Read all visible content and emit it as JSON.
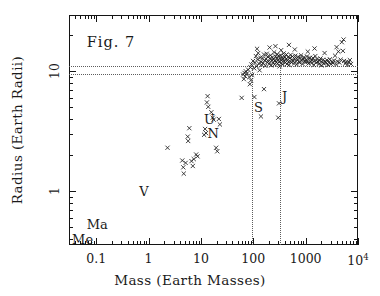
{
  "figure": {
    "label": "Fig. 7",
    "background": "#ffffff",
    "ink": "#1a1a1a"
  },
  "axes": {
    "x": {
      "title": "Mass (Earth Masses)",
      "scale": "log",
      "min": 0.0302,
      "max": 10000,
      "ticks": [
        {
          "value": 0.1,
          "label": "0.1"
        },
        {
          "value": 1,
          "label": "1"
        },
        {
          "value": 10,
          "label": "10"
        },
        {
          "value": 100,
          "label": "100"
        },
        {
          "value": 1000,
          "label": "1000"
        },
        {
          "value": 10000,
          "label": "10",
          "sup": "4"
        }
      ]
    },
    "y": {
      "title": "Radius (Earth Radii)",
      "scale": "log",
      "min": 0.355,
      "max": 29.5,
      "ticks": [
        {
          "value": 1,
          "label": "1"
        },
        {
          "value": 10,
          "label": "10"
        }
      ]
    }
  },
  "guides": {
    "horizontal": [
      {
        "name": "jupiter-radius",
        "value": 11.0
      },
      {
        "name": "saturn-radius",
        "value": 9.45
      }
    ],
    "vertical": [
      {
        "name": "saturn-mass",
        "value": 95.0
      },
      {
        "name": "jupiter-mass",
        "value": 318.0
      }
    ],
    "color": "#5d5d5d"
  },
  "annotations": [
    {
      "name": "mercury-label",
      "text": "Me",
      "x": 0.055,
      "y": 0.4
    },
    {
      "name": "mars-label",
      "text": "Ma",
      "x": 0.105,
      "y": 0.53
    },
    {
      "name": "venus-label",
      "text": "V",
      "x": 0.82,
      "y": 1.0
    },
    {
      "name": "uranus-label",
      "text": "U",
      "x": 14.5,
      "y": 4.0
    },
    {
      "name": "neptune-label",
      "text": "N",
      "x": 17.2,
      "y": 3.05
    },
    {
      "name": "saturn-label",
      "text": "S",
      "x": 125,
      "y": 5.0
    },
    {
      "name": "jupiter-label",
      "text": "J",
      "x": 395,
      "y": 6.2
    }
  ],
  "chart_data": {
    "type": "scatter",
    "title": "Fig. 7",
    "xlabel": "Mass (Earth Masses)",
    "ylabel": "Radius (Earth Radii)",
    "xscale": "log",
    "yscale": "log",
    "xlim": [
      0.0302,
      10000
    ],
    "ylim": [
      0.355,
      29.5
    ],
    "grid": false,
    "legend": null,
    "marker": "x",
    "marker_color": "#1e1e1e",
    "series": [
      {
        "name": "planets",
        "points": [
          [
            2.3,
            2.3
          ],
          [
            4.4,
            1.8
          ],
          [
            4.6,
            1.58
          ],
          [
            4.7,
            1.4
          ],
          [
            5.1,
            1.72
          ],
          [
            5.6,
            2.85
          ],
          [
            5.7,
            2.62
          ],
          [
            6.0,
            3.35
          ],
          [
            6.6,
            1.78
          ],
          [
            7.0,
            1.62
          ],
          [
            7.3,
            1.85
          ],
          [
            8.1,
            2.02
          ],
          [
            8.6,
            1.95
          ],
          [
            11.5,
            2.95
          ],
          [
            12.0,
            3.3
          ],
          [
            12.5,
            3.05
          ],
          [
            13.0,
            5.5
          ],
          [
            13.4,
            6.2
          ],
          [
            13.8,
            5.05
          ],
          [
            15.8,
            4.55
          ],
          [
            16.8,
            4.1
          ],
          [
            17.5,
            3.95
          ],
          [
            19.5,
            2.3
          ],
          [
            20.5,
            2.15
          ],
          [
            22.0,
            4.0
          ],
          [
            23.0,
            3.6
          ],
          [
            60,
            6.0
          ],
          [
            66,
            8.6
          ],
          [
            70,
            9.1
          ],
          [
            76,
            9.6
          ],
          [
            80,
            10.3
          ],
          [
            84,
            8.95
          ],
          [
            88,
            10.8
          ],
          [
            92,
            11.4
          ],
          [
            95,
            9.35
          ],
          [
            99,
            12.2
          ],
          [
            104,
            10.6
          ],
          [
            108,
            11.8
          ],
          [
            112,
            13.4
          ],
          [
            116,
            11.0
          ],
          [
            120,
            12.6
          ],
          [
            124,
            14.2
          ],
          [
            128,
            11.6
          ],
          [
            132,
            10.2
          ],
          [
            136,
            13.0
          ],
          [
            140,
            12.0
          ],
          [
            145,
            11.3
          ],
          [
            150,
            12.9
          ],
          [
            155,
            11.7
          ],
          [
            160,
            13.8
          ],
          [
            165,
            12.3
          ],
          [
            170,
            11.1
          ],
          [
            175,
            12.7
          ],
          [
            180,
            14.0
          ],
          [
            185,
            11.9
          ],
          [
            190,
            13.2
          ],
          [
            196,
            12.1
          ],
          [
            202,
            11.5
          ],
          [
            208,
            12.8
          ],
          [
            214,
            13.6
          ],
          [
            220,
            11.2
          ],
          [
            226,
            12.4
          ],
          [
            232,
            13.1
          ],
          [
            238,
            11.8
          ],
          [
            244,
            12.6
          ],
          [
            250,
            14.4
          ],
          [
            256,
            11.4
          ],
          [
            262,
            12.2
          ],
          [
            268,
            13.3
          ],
          [
            274,
            11.9
          ],
          [
            280,
            12.9
          ],
          [
            286,
            13.9
          ],
          [
            292,
            11.6
          ],
          [
            298,
            12.5
          ],
          [
            305,
            13.4
          ],
          [
            312,
            12.0
          ],
          [
            318,
            11.0
          ],
          [
            325,
            12.8
          ],
          [
            332,
            13.6
          ],
          [
            340,
            11.7
          ],
          [
            348,
            12.3
          ],
          [
            356,
            13.0
          ],
          [
            364,
            11.4
          ],
          [
            372,
            12.7
          ],
          [
            380,
            14.1
          ],
          [
            390,
            12.1
          ],
          [
            400,
            13.2
          ],
          [
            410,
            11.8
          ],
          [
            420,
            12.6
          ],
          [
            430,
            13.8
          ],
          [
            440,
            11.5
          ],
          [
            450,
            12.4
          ],
          [
            462,
            13.1
          ],
          [
            474,
            12.0
          ],
          [
            486,
            11.3
          ],
          [
            500,
            12.9
          ],
          [
            515,
            13.7
          ],
          [
            530,
            11.9
          ],
          [
            546,
            12.5
          ],
          [
            562,
            13.3
          ],
          [
            580,
            12.2
          ],
          [
            598,
            11.6
          ],
          [
            616,
            12.8
          ],
          [
            636,
            13.5
          ],
          [
            656,
            12.1
          ],
          [
            676,
            11.4
          ],
          [
            698,
            12.6
          ],
          [
            720,
            13.2
          ],
          [
            744,
            12.0
          ],
          [
            768,
            11.8
          ],
          [
            792,
            12.9
          ],
          [
            818,
            13.6
          ],
          [
            844,
            12.3
          ],
          [
            872,
            11.5
          ],
          [
            900,
            12.7
          ],
          [
            930,
            13.1
          ],
          [
            960,
            12.2
          ],
          [
            992,
            11.9
          ],
          [
            1024,
            12.5
          ],
          [
            1060,
            13.3
          ],
          [
            1096,
            12.0
          ],
          [
            1132,
            11.6
          ],
          [
            1170,
            12.8
          ],
          [
            1210,
            13.0
          ],
          [
            1250,
            12.1
          ],
          [
            1292,
            11.7
          ],
          [
            1336,
            12.4
          ],
          [
            1380,
            12.9
          ],
          [
            1430,
            11.3
          ],
          [
            1480,
            12.2
          ],
          [
            1530,
            13.4
          ],
          [
            1590,
            11.8
          ],
          [
            1650,
            12.6
          ],
          [
            1710,
            12.0
          ],
          [
            1780,
            11.5
          ],
          [
            1850,
            12.3
          ],
          [
            1920,
            12.8
          ],
          [
            2000,
            11.2
          ],
          [
            2080,
            11.9
          ],
          [
            2160,
            12.5
          ],
          [
            2250,
            11.6
          ],
          [
            2350,
            12.1
          ],
          [
            2450,
            11.8
          ],
          [
            2550,
            12.4
          ],
          [
            2660,
            11.3
          ],
          [
            2780,
            11.9
          ],
          [
            2900,
            12.6
          ],
          [
            3030,
            11.5
          ],
          [
            3170,
            12.0
          ],
          [
            3320,
            11.7
          ],
          [
            3480,
            12.3
          ],
          [
            3650,
            13.5
          ],
          [
            3830,
            11.4
          ],
          [
            4020,
            12.1
          ],
          [
            4220,
            14.6
          ],
          [
            4430,
            11.8
          ],
          [
            4660,
            12.5
          ],
          [
            4900,
            17.5
          ],
          [
            5150,
            14.8
          ],
          [
            5420,
            12.2
          ],
          [
            5700,
            11.6
          ],
          [
            6000,
            12.0
          ],
          [
            6320,
            11.3
          ],
          [
            6650,
            11.9
          ],
          [
            7000,
            12.4
          ],
          [
            7370,
            11.5
          ],
          [
            105,
            6.1
          ],
          [
            140,
            4.2
          ],
          [
            160,
            7.1
          ],
          [
            300,
            4.1
          ],
          [
            310,
            5.4
          ],
          [
            86,
            7.8
          ],
          [
            90,
            8.4
          ],
          [
            118,
            15.4
          ],
          [
            205,
            15.8
          ],
          [
            265,
            16.2
          ],
          [
            340,
            15.0
          ],
          [
            480,
            16.6
          ],
          [
            620,
            15.2
          ],
          [
            1100,
            14.6
          ],
          [
            1480,
            15.5
          ],
          [
            2300,
            14.2
          ],
          [
            3900,
            15.9
          ],
          [
            5300,
            18.4
          ],
          [
            72,
            10.0
          ],
          [
            68,
            9.7
          ],
          [
            64,
            9.4
          ]
        ]
      }
    ]
  }
}
